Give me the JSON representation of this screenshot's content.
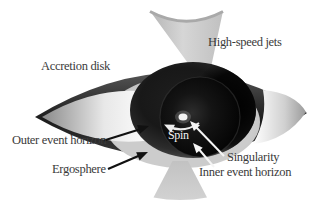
{
  "figure": {
    "type": "black-hole-anatomy-diagram",
    "labels": {
      "high_speed_jets": "High-speed jets",
      "accretion_disk": "Accretion disk",
      "outer_event_horizon": "Outer event horizon",
      "ergosphere": "Ergosphere",
      "spin": "Spin",
      "singularity": "Singularity",
      "inner_event_horizon": "Inner event horizon"
    },
    "colors": {
      "background": "#ffffff",
      "jet_gray": "#c9c9c9",
      "disk_dark_band": "#2e2e2e",
      "disk_highlight": "#ffffff",
      "ergosphere_gray": "#c5c5c5",
      "sphere_dark": "#161616",
      "inner_horizon_dark": "#050505",
      "singularity_white": "#f2f2f2",
      "label_text": "#3a3a3a",
      "annotation_white_arrows": "#f5f5f5",
      "annotation_black_arrows": "#111111"
    }
  }
}
